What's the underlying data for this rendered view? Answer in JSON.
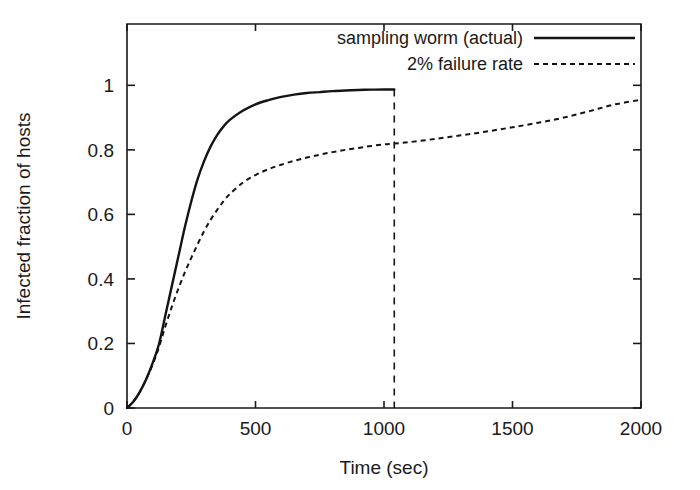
{
  "chart_data": {
    "type": "line",
    "title": "",
    "xlabel": "Time (sec)",
    "ylabel": "Infected fraction of hosts",
    "xlim": [
      0,
      2000
    ],
    "ylim": [
      0,
      1.19
    ],
    "grid": false,
    "legend_position": "top-right-inside",
    "xticks": [
      0,
      500,
      1000,
      1500,
      2000
    ],
    "xtick_labels": [
      "0",
      "500",
      "1000",
      "1500",
      "2000"
    ],
    "yticks": [
      0,
      0.2,
      0.4,
      0.6,
      0.8,
      1
    ],
    "ytick_labels": [
      "0",
      "0.2",
      "0.4",
      "0.6",
      "0.8",
      "1"
    ],
    "annotations": [
      {
        "name": "worm-termination-marker",
        "type": "vertical-dashed-line",
        "x": 1040,
        "y_from": 0,
        "y_to": 0.987
      }
    ],
    "series": [
      {
        "name": "sampling worm (actual)",
        "style": "solid",
        "color": "#141414",
        "x": [
          0,
          25,
          50,
          75,
          100,
          125,
          150,
          175,
          200,
          225,
          250,
          275,
          300,
          325,
          350,
          375,
          400,
          450,
          500,
          550,
          600,
          650,
          700,
          750,
          800,
          850,
          900,
          950,
          1000,
          1040
        ],
        "y": [
          0.0,
          0.02,
          0.05,
          0.09,
          0.14,
          0.2,
          0.29,
          0.38,
          0.47,
          0.56,
          0.64,
          0.71,
          0.765,
          0.81,
          0.845,
          0.872,
          0.893,
          0.921,
          0.941,
          0.954,
          0.964,
          0.971,
          0.976,
          0.979,
          0.982,
          0.984,
          0.9855,
          0.9865,
          0.987,
          0.987
        ]
      },
      {
        "name": "2% failure rate",
        "style": "dashed",
        "color": "#141414",
        "x": [
          0,
          25,
          50,
          75,
          100,
          125,
          150,
          175,
          200,
          225,
          250,
          275,
          300,
          325,
          350,
          375,
          400,
          450,
          500,
          550,
          600,
          650,
          700,
          750,
          800,
          850,
          900,
          950,
          1000,
          1040,
          1100,
          1200,
          1300,
          1400,
          1500,
          1600,
          1700,
          1800,
          1900,
          2000
        ],
        "y": [
          0.0,
          0.02,
          0.05,
          0.09,
          0.135,
          0.19,
          0.255,
          0.315,
          0.37,
          0.42,
          0.465,
          0.508,
          0.548,
          0.583,
          0.613,
          0.64,
          0.663,
          0.698,
          0.722,
          0.74,
          0.754,
          0.766,
          0.776,
          0.785,
          0.793,
          0.8,
          0.806,
          0.812,
          0.817,
          0.8195,
          0.824,
          0.834,
          0.845,
          0.857,
          0.87,
          0.884,
          0.9,
          0.92,
          0.941,
          0.955
        ]
      }
    ]
  },
  "legend": {
    "entries": [
      {
        "label": "sampling worm (actual)",
        "style": "solid"
      },
      {
        "label": "2% failure rate",
        "style": "dashed"
      }
    ]
  },
  "axes": {
    "x_title": "Time (sec)",
    "y_title": "Infected fraction of hosts"
  },
  "colors": {
    "ink": "#141414",
    "background": "#ffffff"
  }
}
